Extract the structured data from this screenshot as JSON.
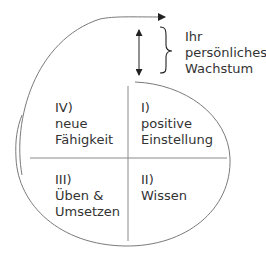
{
  "diagram": {
    "type": "growth-cycle",
    "growth_label": {
      "lines": [
        "Ihr",
        "persönliches",
        "Wachstum"
      ]
    },
    "quadrants": [
      {
        "id": "I",
        "number": "I)",
        "lines": [
          "positive",
          "Einstellung"
        ],
        "position": "top-right"
      },
      {
        "id": "II",
        "number": "II)",
        "lines": [
          "Wissen"
        ],
        "position": "bottom-right"
      },
      {
        "id": "III",
        "number": "III)",
        "lines": [
          "Üben &",
          "Umsetzen"
        ],
        "position": "bottom-left"
      },
      {
        "id": "IV",
        "number": "IV)",
        "lines": [
          "neue",
          "Fähigkeit"
        ],
        "position": "top-left"
      }
    ],
    "colors": {
      "line": "#7a7a7a",
      "arrow": "#222222",
      "text": "#333333"
    }
  }
}
